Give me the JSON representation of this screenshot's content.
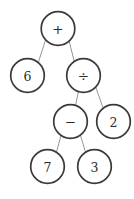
{
  "figure": {
    "kind": "expression-tree",
    "expression": "6 + ((7 - 3) / 2)",
    "background_color": "#ffffff",
    "node_stroke_color": "#3a3a3a",
    "node_fill_color": "#ffffff",
    "edge_color": "#8a8a8a",
    "label_color": "#2b2b2b",
    "node_radius": 16.8
  },
  "nodes": [
    {
      "id": "root",
      "label": "+",
      "kind": "operator",
      "cx": 58,
      "cy": 28.5,
      "r": 16.8
    },
    {
      "id": "six",
      "label": "6",
      "kind": "operand",
      "cx": 27.5,
      "cy": 75.5,
      "r": 16.8
    },
    {
      "id": "divide",
      "label": "÷",
      "kind": "operator",
      "cx": 83.5,
      "cy": 75.5,
      "r": 16.8
    },
    {
      "id": "minus",
      "label": "−",
      "kind": "operator",
      "cx": 70.5,
      "cy": 121.5,
      "r": 16.8
    },
    {
      "id": "two",
      "label": "2",
      "kind": "operand",
      "cx": 113.5,
      "cy": 121.5,
      "r": 16.8
    },
    {
      "id": "seven",
      "label": "7",
      "kind": "operand",
      "cx": 47.5,
      "cy": 166.5,
      "r": 16.8
    },
    {
      "id": "three",
      "label": "3",
      "kind": "operand",
      "cx": 94.5,
      "cy": 166.5,
      "r": 16.8
    }
  ],
  "edges": [
    {
      "id": "root-six",
      "from": "root",
      "to": "six",
      "x1": 45.5,
      "y1": 40.0,
      "x2": 38.0,
      "y2": 63.5
    },
    {
      "id": "root-divide",
      "from": "root",
      "to": "divide",
      "x1": 69.0,
      "y1": 40.5,
      "x2": 74.5,
      "y2": 62.5
    },
    {
      "id": "divide-minus",
      "from": "divide",
      "to": "minus",
      "x1": 78.5,
      "y1": 91.5,
      "x2": 75.5,
      "y2": 105.5
    },
    {
      "id": "divide-two",
      "from": "divide",
      "to": "two",
      "x1": 95.5,
      "y1": 86.5,
      "x2": 104.0,
      "y2": 110.5
    },
    {
      "id": "minus-seven",
      "from": "minus",
      "to": "seven",
      "x1": 61.0,
      "y1": 135.5,
      "x2": 56.5,
      "y2": 152.0
    },
    {
      "id": "minus-three",
      "from": "minus",
      "to": "three",
      "x1": 80.5,
      "y1": 135.5,
      "x2": 85.5,
      "y2": 152.0
    }
  ]
}
